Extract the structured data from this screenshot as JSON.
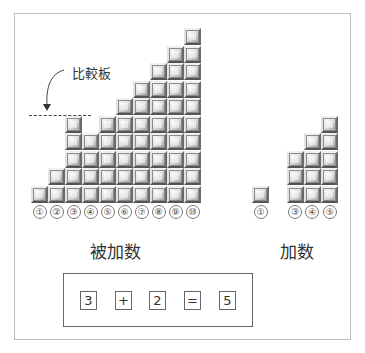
{
  "diagram": {
    "comparison_board_label": "比較板",
    "augend": {
      "caption": "被加数",
      "columns": [
        {
          "label": "①",
          "height": 1
        },
        {
          "label": "②",
          "height": 2
        },
        {
          "label": "③",
          "height": 5
        },
        {
          "label": "④",
          "height": 4
        },
        {
          "label": "⑤",
          "height": 5
        },
        {
          "label": "⑥",
          "height": 6
        },
        {
          "label": "⑦",
          "height": 7
        },
        {
          "label": "⑧",
          "height": 8
        },
        {
          "label": "⑨",
          "height": 9
        },
        {
          "label": "⑩",
          "height": 10
        }
      ]
    },
    "addend": {
      "caption": "加数",
      "columns": [
        {
          "label": "①",
          "height": 1
        },
        {
          "label": "",
          "height": 0
        },
        {
          "label": "③",
          "height": 3
        },
        {
          "label": "④",
          "height": 4
        },
        {
          "label": "⑤",
          "height": 5
        }
      ]
    },
    "equation": [
      "3",
      "+",
      "2",
      "=",
      "5"
    ]
  }
}
